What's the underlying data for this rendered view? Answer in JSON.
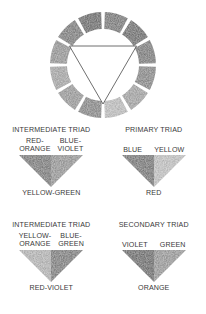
{
  "diagram": {
    "title_visible": false,
    "wheel": {
      "name": "twelve-step-color-wheel",
      "segment_count": 12,
      "has_inscribed_triangle": true,
      "triangle_points_down": true,
      "segments": [
        {
          "position": 12,
          "tone": "#6b6b6b"
        },
        {
          "position": 1,
          "tone": "#5f5f5f"
        },
        {
          "position": 2,
          "tone": "#6e6e6e"
        },
        {
          "position": 3,
          "tone": "#7b7b7b"
        },
        {
          "position": 4,
          "tone": "#9a9a9a"
        },
        {
          "position": 5,
          "tone": "#b9b9b9"
        },
        {
          "position": 6,
          "tone": "#7a7a7a"
        },
        {
          "position": 7,
          "tone": "#8f8f8f"
        },
        {
          "position": 8,
          "tone": "#9d9d9d"
        },
        {
          "position": 9,
          "tone": "#8a8a8a"
        },
        {
          "position": 10,
          "tone": "#6f6f6f"
        },
        {
          "position": 11,
          "tone": "#5a5a5a"
        }
      ]
    },
    "triads": [
      {
        "id": "intermediate-triad-1",
        "heading": "INTERMEDIATE TRIAD",
        "top_labels": [
          "RED-\nORANGE",
          "BLUE-\nVIOLET"
        ],
        "top_labels_multiline": true,
        "bottom_label": "YELLOW-GREEN",
        "left_tone": "#6d6d6d",
        "right_tone": "#8c8c8c"
      },
      {
        "id": "primary-triad",
        "heading": "PRIMARY TRIAD",
        "top_labels": [
          "BLUE",
          "YELLOW"
        ],
        "top_labels_multiline": false,
        "bottom_label": "RED",
        "left_tone": "#686868",
        "right_tone": "#bdbdbd"
      },
      {
        "id": "intermediate-triad-2",
        "heading": "INTERMEDIATE TRIAD",
        "top_labels": [
          "YELLOW-\nORANGE",
          "BLUE-\nGREEN"
        ],
        "top_labels_multiline": true,
        "bottom_label": "RED-VIOLET",
        "left_tone": "#aeaeae",
        "right_tone": "#6f6f6f"
      },
      {
        "id": "secondary-triad",
        "heading": "SECONDARY TRIAD",
        "top_labels": [
          "VIOLET",
          "GREEN"
        ],
        "top_labels_multiline": false,
        "bottom_label": "ORANGE",
        "left_tone": "#5c5c5c",
        "right_tone": "#8e8e8e"
      }
    ]
  }
}
